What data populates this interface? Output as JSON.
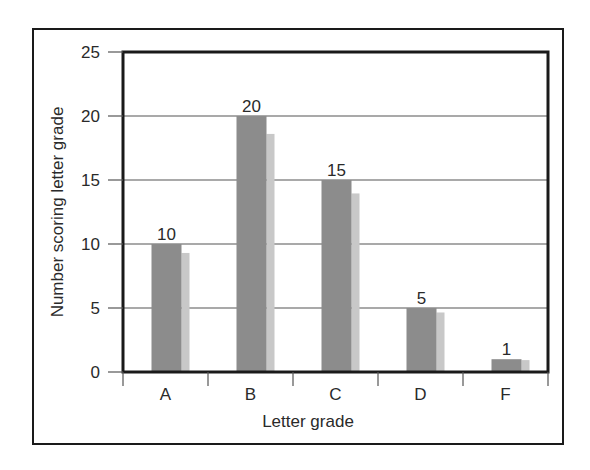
{
  "chart_data": {
    "type": "bar",
    "title": "",
    "xlabel": "Letter grade",
    "ylabel": "Number scoring letter grade",
    "categories": [
      "A",
      "B",
      "C",
      "D",
      "F"
    ],
    "values": [
      10,
      20,
      15,
      5,
      1
    ],
    "data_labels": [
      "10",
      "20",
      "15",
      "5",
      "1"
    ],
    "ylim": [
      0,
      25
    ],
    "yticks": [
      0,
      5,
      10,
      15,
      20,
      25
    ],
    "ytick_labels": [
      "0",
      "5",
      "10",
      "15",
      "20",
      "25"
    ],
    "grid": true,
    "legend": null,
    "style": {
      "bar_color": "#8c8c8c",
      "bar_shadow_color": "#c8c8c8",
      "frame_color": "#1a1a1a",
      "grid_color": "#555555"
    }
  }
}
